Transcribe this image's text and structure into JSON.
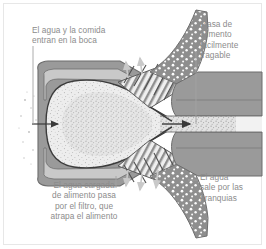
{
  "figure": {
    "kind": "anatomical-cross-section",
    "background_color": "#ffffff",
    "frame_color": "#e7e7e7",
    "palette": {
      "tissue_gray": "#9a9a9a",
      "tissue_gray_dark": "#7d7d7d",
      "outline": "#6b6b6b",
      "outline_dark": "#4a4a4a",
      "cavity_light": "#ececec",
      "cavity_speckle": "#f2f2f2",
      "flap_dark": "#8e8e8e",
      "flap_dots": "#ffffff",
      "label_text": "#8c8c8c",
      "leader_line": "#9a9a9a",
      "arrow": "#3a3a3a"
    },
    "labels": {
      "mouth": "El agua y la comida\nentran en la boca",
      "mass": "Masa de\nalimento\nfácilmente\ntragable",
      "filter": "El agua cargada\nde alimento pasa\npor el filtro, que\natrapa el alimento",
      "gills": "El agua\nsale por las\nbranquias"
    },
    "annotations": {
      "intake_arrow": "arrow pointing right into the mouth cavity",
      "throat_arrow": "arrow pointing right along the esophagus",
      "water_exit_arrows": "pale arrows exiting upward and downward through the gill slits"
    }
  }
}
